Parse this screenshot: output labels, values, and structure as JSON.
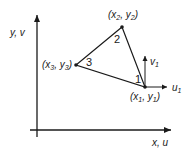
{
  "diagram": {
    "type": "triangular-finite-element",
    "axes": {
      "y_label": "y, v",
      "x_label": "x, u"
    },
    "nodes": [
      {
        "id": "1",
        "label": "1",
        "coord_var": "x",
        "coord_sub": "1",
        "coord_var2": "y",
        "coord_sub2": "1",
        "x": 145,
        "y": 87
      },
      {
        "id": "2",
        "label": "2",
        "coord_var": "x",
        "coord_sub": "2",
        "coord_var2": "y",
        "coord_sub2": "2",
        "x": 122,
        "y": 27
      },
      {
        "id": "3",
        "label": "3",
        "coord_var": "x",
        "coord_sub": "3",
        "coord_var2": "y",
        "coord_sub2": "3",
        "x": 76,
        "y": 65
      }
    ],
    "displacements": {
      "u": {
        "var": "u",
        "sub": "1"
      },
      "v": {
        "var": "v",
        "sub": "1"
      }
    },
    "colors": {
      "line": "#1a1a1a",
      "background": "#ffffff"
    }
  }
}
